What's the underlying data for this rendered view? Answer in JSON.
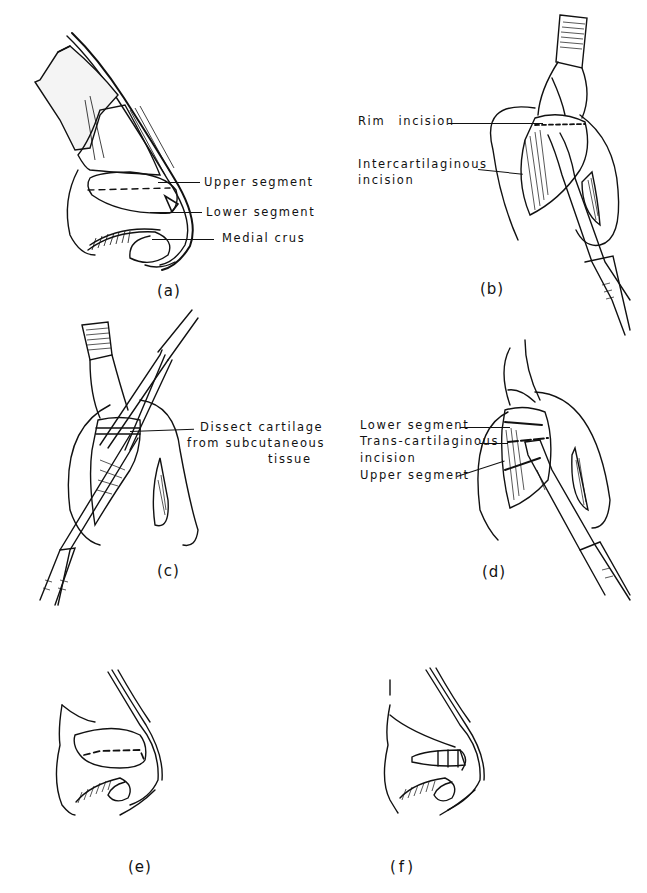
{
  "figure": {
    "panels": [
      {
        "id": "a",
        "caption": "(a)",
        "labels": [
          "Upper segment",
          "Lower segment",
          "Medial crus"
        ]
      },
      {
        "id": "b",
        "caption": "(b)",
        "labels": [
          "Rim incision",
          "Intercartilaginous",
          "incision"
        ]
      },
      {
        "id": "c",
        "caption": "(c)",
        "labels": [
          "Dissect cartilage",
          "from subcutaneous",
          "tissue"
        ]
      },
      {
        "id": "d",
        "caption": "(d)",
        "labels": [
          "Lower segment",
          "Trans-cartilaginous",
          "incision",
          "Upper segment"
        ]
      },
      {
        "id": "e",
        "caption": "(e)",
        "labels": []
      },
      {
        "id": "f",
        "caption": "(f)",
        "labels": []
      }
    ],
    "colors": {
      "ink": "#111111",
      "background": "#ffffff"
    }
  }
}
